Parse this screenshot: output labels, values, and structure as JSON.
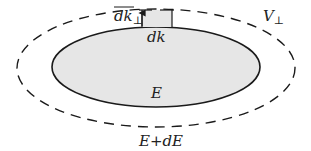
{
  "diagram": {
    "type": "energy-surface",
    "labels": {
      "dk_perp": "dk",
      "dk_perp_sub": "⊥",
      "dk": "dk",
      "v_perp": "V",
      "v_perp_sub": "⊥",
      "e": "E",
      "e_plus_de": "E+dE"
    },
    "colors": {
      "inner_fill": "#e6e6e6",
      "stroke": "#1a1a1a",
      "background": "#ffffff"
    }
  }
}
